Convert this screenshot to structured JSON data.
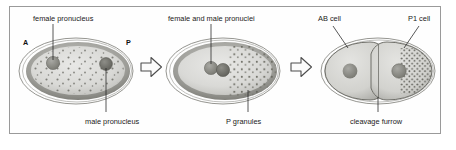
{
  "figure": {
    "border_color": "#9a9a9a",
    "background_color": "#fefefe",
    "ink_color": "#1a1a1a"
  },
  "panels": [
    {
      "id": "panel-1",
      "name": "one-cell-zygote-pronuclei-apart",
      "axis": {
        "anterior_label": "A",
        "posterior_label": "P"
      },
      "labels": [
        {
          "name": "female-pronucleus-label",
          "text": "female pronucleus",
          "position": "top"
        },
        {
          "name": "male-pronucleus-label",
          "text": "male pronucleus",
          "position": "bottom"
        }
      ],
      "structures": [
        {
          "name": "eggshell",
          "kind": "outline-ellipse"
        },
        {
          "name": "cortex",
          "kind": "shaded-ring"
        },
        {
          "name": "cytoplasm",
          "kind": "fill"
        },
        {
          "name": "female-pronucleus",
          "kind": "circle",
          "side": "anterior"
        },
        {
          "name": "male-pronucleus",
          "kind": "circle",
          "side": "posterior"
        },
        {
          "name": "p-granules-dispersed",
          "kind": "dot-field"
        }
      ]
    },
    {
      "id": "panel-2",
      "name": "pronuclei-met-p-granules-posterior",
      "labels": [
        {
          "name": "female-and-male-pronuclei-label",
          "text": "female and male pronuclei",
          "position": "top"
        },
        {
          "name": "p-granules-label",
          "text": "P granules",
          "position": "bottom"
        }
      ],
      "structures": [
        {
          "name": "eggshell",
          "kind": "outline-ellipse"
        },
        {
          "name": "cortex",
          "kind": "shaded-ring"
        },
        {
          "name": "cytoplasm",
          "kind": "fill"
        },
        {
          "name": "female-pronucleus",
          "kind": "circle"
        },
        {
          "name": "male-pronucleus",
          "kind": "circle"
        },
        {
          "name": "p-granules-posterior",
          "kind": "dot-field"
        }
      ]
    },
    {
      "id": "panel-3",
      "name": "two-cell-embryo-ab-and-p1",
      "labels": [
        {
          "name": "ab-cell-label",
          "text": "AB cell",
          "position": "top-left"
        },
        {
          "name": "p1-cell-label",
          "text": "P1 cell",
          "position": "top-right"
        },
        {
          "name": "cleavage-furrow-label",
          "text": "cleavage furrow",
          "position": "bottom"
        }
      ],
      "structures": [
        {
          "name": "eggshell",
          "kind": "outline-ellipse"
        },
        {
          "name": "ab-cell",
          "kind": "daughter-cell"
        },
        {
          "name": "p1-cell",
          "kind": "daughter-cell"
        },
        {
          "name": "ab-nucleus",
          "kind": "circle"
        },
        {
          "name": "p1-nucleus",
          "kind": "circle"
        },
        {
          "name": "cleavage-furrow",
          "kind": "indentation"
        },
        {
          "name": "p-granules-in-p1",
          "kind": "dot-field"
        }
      ]
    }
  ],
  "arrows": [
    {
      "name": "stage-arrow-1",
      "direction": "right"
    },
    {
      "name": "stage-arrow-2",
      "direction": "right"
    }
  ]
}
